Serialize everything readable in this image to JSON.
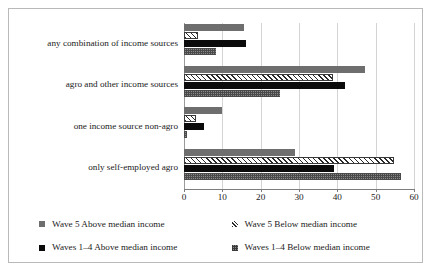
{
  "chart_data": {
    "type": "bar",
    "orientation": "horizontal",
    "title": "",
    "xlabel": "",
    "ylabel": "",
    "xlim": [
      0,
      60
    ],
    "xticks": [
      0,
      10,
      20,
      30,
      40,
      50,
      60
    ],
    "xtick_labels": [
      "0",
      "10",
      "20",
      "30",
      "40",
      "50",
      "60"
    ],
    "grid": true,
    "grid_axis": "x",
    "legend_position": "bottom",
    "categories": [
      "any combination of income sources",
      "agro and other income sources",
      "one income source non-agro",
      "only self-employed agro"
    ],
    "series": [
      {
        "name": "Wave 5 Above median income",
        "color": "#6e6e6e",
        "pattern": "solid-gray",
        "values": [
          15.6,
          47.3,
          10.0,
          28.9
        ]
      },
      {
        "name": "Wave 5 Below median income",
        "color": "#ffffff",
        "pattern": "diagonal-hatch",
        "values": [
          3.7,
          38.9,
          3.1,
          54.7
        ]
      },
      {
        "name": "Waves 1–4 Above median income",
        "color": "#0b0b0b",
        "pattern": "solid-black",
        "values": [
          16.2,
          42.0,
          5.2,
          39.2
        ]
      },
      {
        "name": "Waves 1–4 Below median income",
        "color": "#8a8a8a",
        "pattern": "checker",
        "values": [
          8.4,
          25.0,
          0.8,
          56.7
        ]
      }
    ]
  },
  "legend": {
    "entries": [
      {
        "label": "Wave 5 Above median income",
        "swatch": "solid-gray"
      },
      {
        "label": "Wave 5 Below median income",
        "swatch": "diagonal-hatch"
      },
      {
        "label": "Waves 1–4 Above median income",
        "swatch": "solid-black"
      },
      {
        "label": "Waves 1–4 Below median income",
        "swatch": "checker"
      }
    ]
  }
}
